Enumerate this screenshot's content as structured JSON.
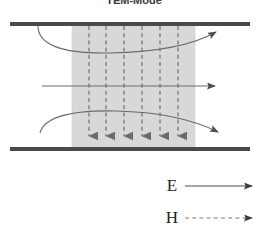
{
  "figure": {
    "title": "TEM-Mode",
    "background_color": "#ffffff",
    "plate_color": "#4a4a4a",
    "shaded_region_color": "#d8d8d8",
    "e_field_color": "#555555",
    "h_field_color": "#6e6e6e",
    "structure": {
      "top_plate": {
        "label": "top-conductor-plate",
        "x1": 10,
        "x2": 250,
        "y": 22,
        "thickness": 4
      },
      "bottom_plate": {
        "label": "bottom-conductor-plate",
        "x1": 10,
        "x2": 250,
        "y": 148,
        "thickness": 4
      },
      "dielectric_region": {
        "label": "field-region",
        "x": 72,
        "y": 24,
        "width": 123,
        "height": 124
      }
    },
    "e_field_lines": [
      {
        "name": "e-line-top-curve",
        "type": "curved",
        "arrow": true
      },
      {
        "name": "e-line-middle-straight",
        "type": "straight",
        "arrow": true
      },
      {
        "name": "e-line-bottom-curve",
        "type": "curved",
        "arrow": true
      }
    ],
    "h_field_lines": {
      "name": "h-field-dashed-verticals",
      "count": 6,
      "style": "dashed",
      "direction": "downward",
      "x_positions": [
        89,
        106,
        124,
        142,
        160,
        178
      ],
      "y_top": 26,
      "y_bottom": 147
    }
  },
  "legend": {
    "items": [
      {
        "symbol": "E",
        "name": "legend-e-field",
        "line_style": "solid"
      },
      {
        "symbol": "H",
        "name": "legend-h-field",
        "line_style": "dashed"
      }
    ]
  }
}
